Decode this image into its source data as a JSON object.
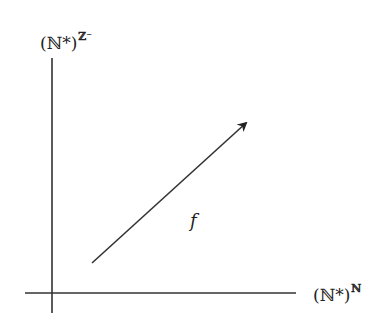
{
  "diagram": {
    "y_axis_label": {
      "base": "(ℕ*)",
      "exponent": "ℤ⁻"
    },
    "x_axis_label": {
      "base": "(ℕ*)",
      "exponent": "ℕ"
    },
    "arrow_label": "f",
    "colors": {
      "line": "#333333",
      "background": "#ffffff"
    }
  }
}
